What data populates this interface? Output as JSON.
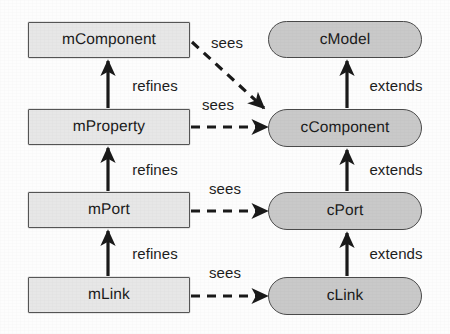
{
  "diagram": {
    "type": "directed-graph",
    "colors": {
      "model_fill": "#e7e7e7",
      "model_stroke": "#565656",
      "code_fill": "#c9c9c9",
      "code_stroke": "#4a4a4a",
      "text": "#1b1b1b",
      "edge": "#1a1a1a",
      "background": "#fdfdfd"
    },
    "nodes": [
      {
        "id": "mComponent",
        "label": "mComponent",
        "shape": "rectangle",
        "column": "model",
        "x": 28,
        "y": 22,
        "w": 162,
        "h": 36
      },
      {
        "id": "mProperty",
        "label": "mProperty",
        "shape": "rectangle",
        "column": "model",
        "x": 28,
        "y": 109,
        "w": 162,
        "h": 36
      },
      {
        "id": "mPort",
        "label": "mPort",
        "shape": "rectangle",
        "column": "model",
        "x": 28,
        "y": 192,
        "w": 162,
        "h": 36
      },
      {
        "id": "mLink",
        "label": "mLink",
        "shape": "rectangle",
        "column": "model",
        "x": 28,
        "y": 277,
        "w": 162,
        "h": 36
      },
      {
        "id": "cModel",
        "label": "cModel",
        "shape": "stadium",
        "column": "code",
        "x": 268,
        "y": 21,
        "w": 154,
        "h": 37
      },
      {
        "id": "cComponent",
        "label": "cComponent",
        "shape": "stadium",
        "column": "code",
        "x": 268,
        "y": 109,
        "w": 154,
        "h": 38
      },
      {
        "id": "cPort",
        "label": "cPort",
        "shape": "stadium",
        "column": "code",
        "x": 268,
        "y": 192,
        "w": 154,
        "h": 38
      },
      {
        "id": "cLink",
        "label": "cLink",
        "shape": "stadium",
        "column": "code",
        "x": 268,
        "y": 277,
        "w": 154,
        "h": 38
      }
    ],
    "edges": [
      {
        "id": "e1",
        "from": "mProperty",
        "to": "mComponent",
        "label": "refines",
        "style": "solid",
        "label_x": 155,
        "label_y": 85
      },
      {
        "id": "e2",
        "from": "mPort",
        "to": "mProperty",
        "label": "refines",
        "style": "solid",
        "label_x": 155,
        "label_y": 169
      },
      {
        "id": "e3",
        "from": "mLink",
        "to": "mPort",
        "label": "refines",
        "style": "solid",
        "label_x": 155,
        "label_y": 253
      },
      {
        "id": "e4",
        "from": "cComponent",
        "to": "cModel",
        "label": "extends",
        "style": "solid",
        "label_x": 396,
        "label_y": 85
      },
      {
        "id": "e5",
        "from": "cPort",
        "to": "cComponent",
        "label": "extends",
        "style": "solid",
        "label_x": 396,
        "label_y": 169
      },
      {
        "id": "e6",
        "from": "cLink",
        "to": "cPort",
        "label": "extends",
        "style": "solid",
        "label_x": 396,
        "label_y": 253
      },
      {
        "id": "e7",
        "from": "mComponent",
        "to": "cComponent",
        "label": "sees",
        "style": "dashed",
        "label_x": 227,
        "label_y": 42
      },
      {
        "id": "e8",
        "from": "mProperty",
        "to": "cComponent",
        "label": "sees",
        "style": "dashed",
        "label_x": 218,
        "label_y": 104
      },
      {
        "id": "e9",
        "from": "mPort",
        "to": "cPort",
        "label": "sees",
        "style": "dashed",
        "label_x": 225,
        "label_y": 188
      },
      {
        "id": "e10",
        "from": "mLink",
        "to": "cLink",
        "label": "sees",
        "style": "dashed",
        "label_x": 225,
        "label_y": 272
      }
    ]
  }
}
